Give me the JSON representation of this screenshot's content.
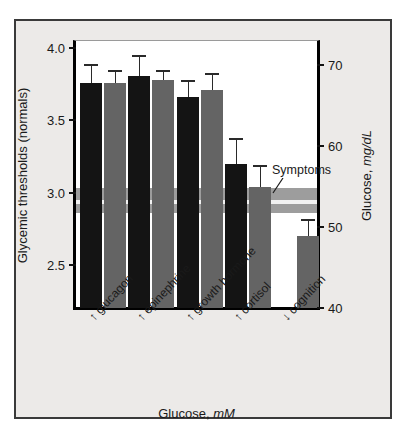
{
  "chart_data": {
    "type": "bar",
    "title": "",
    "xlabel": "Glucose, mM",
    "ylabel": "Glycemic thresholds (normals)",
    "ylabel_right": "Glucose, mg/dL",
    "ylim": [
      2.2,
      4.05
    ],
    "ylim_right": [
      40,
      73
    ],
    "ytick_labels": [
      "4.0",
      "3.5",
      "3.0",
      "2.5"
    ],
    "ytick_values": [
      4.0,
      3.5,
      3.0,
      2.5
    ],
    "ytick_labels_right": [
      "70",
      "60",
      "50",
      "40"
    ],
    "ytick_values_right": [
      70,
      60,
      50,
      40
    ],
    "grid": false,
    "legend": "none",
    "categories": [
      "↑ glucagon",
      "↑ epinephrine",
      "↑ growth hormone",
      "↑ cortisol",
      "↓ cognition"
    ],
    "series": [
      {
        "name": "series-dark",
        "color": "#141414",
        "values": [
          3.76,
          3.81,
          3.66,
          3.2,
          null
        ],
        "errors_upper": [
          3.89,
          3.95,
          3.78,
          3.38,
          null
        ],
        "errors_lower": [
          3.76,
          3.81,
          3.66,
          3.2,
          null
        ]
      },
      {
        "name": "series-gray",
        "color": "#646464",
        "values": [
          3.76,
          3.78,
          3.71,
          3.04,
          2.7
        ],
        "errors_upper": [
          3.85,
          3.85,
          3.83,
          3.19,
          2.82
        ],
        "errors_lower": [
          3.76,
          3.78,
          3.71,
          3.04,
          2.7
        ]
      }
    ],
    "annotations": [
      {
        "name": "symptoms",
        "label": "Symptoms",
        "band_top": 3.03,
        "band_bottom": 2.86,
        "band_center_line": 2.935,
        "band_color": "#9d9d9d",
        "center_line_color": "#f2f2f2"
      }
    ]
  },
  "figure": {
    "background": "#eceae8",
    "plot_background": "#ffffff",
    "border_color": "#3a3a3a"
  }
}
